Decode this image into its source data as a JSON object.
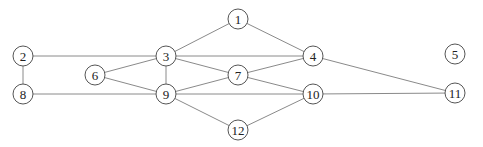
{
  "graph": {
    "node_radius": 10,
    "nodes": [
      {
        "id": "1",
        "x": 238,
        "y": 19
      },
      {
        "id": "2",
        "x": 23,
        "y": 56
      },
      {
        "id": "3",
        "x": 166,
        "y": 56
      },
      {
        "id": "4",
        "x": 313,
        "y": 56
      },
      {
        "id": "5",
        "x": 455,
        "y": 54
      },
      {
        "id": "6",
        "x": 95,
        "y": 75
      },
      {
        "id": "7",
        "x": 238,
        "y": 75
      },
      {
        "id": "8",
        "x": 23,
        "y": 94
      },
      {
        "id": "9",
        "x": 166,
        "y": 94
      },
      {
        "id": "10",
        "x": 313,
        "y": 94
      },
      {
        "id": "11",
        "x": 455,
        "y": 93
      },
      {
        "id": "12",
        "x": 238,
        "y": 130
      }
    ],
    "edges": [
      [
        "1",
        "3"
      ],
      [
        "1",
        "4"
      ],
      [
        "2",
        "3"
      ],
      [
        "2",
        "8"
      ],
      [
        "3",
        "4"
      ],
      [
        "3",
        "6"
      ],
      [
        "3",
        "7"
      ],
      [
        "3",
        "9"
      ],
      [
        "4",
        "7"
      ],
      [
        "4",
        "11"
      ],
      [
        "6",
        "9"
      ],
      [
        "7",
        "9"
      ],
      [
        "7",
        "10"
      ],
      [
        "8",
        "9"
      ],
      [
        "9",
        "10"
      ],
      [
        "9",
        "12"
      ],
      [
        "10",
        "11"
      ],
      [
        "10",
        "12"
      ]
    ]
  }
}
